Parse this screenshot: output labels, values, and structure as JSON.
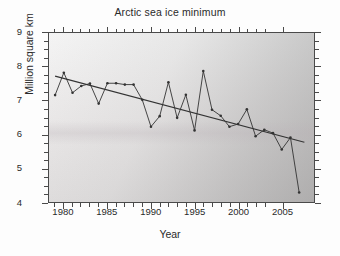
{
  "chart_data": {
    "type": "line",
    "title": "Arctic sea ice minimum",
    "xlabel": "Year",
    "ylabel": "Million square km",
    "xlim": [
      1978.3,
      2008.7
    ],
    "ylim": [
      4,
      9
    ],
    "xticks": [
      1980,
      1985,
      1990,
      1995,
      2000,
      2005
    ],
    "xtick_labels": [
      "1980",
      "1985",
      "1990",
      "1995",
      "2000",
      "2005"
    ],
    "yticks": [
      4,
      5,
      6,
      7,
      8,
      9
    ],
    "ytick_labels": [
      "4",
      "5",
      "6",
      "7",
      "8",
      "9"
    ],
    "minor_tick_interval_x": 1,
    "minor_tick_interval_y": 0.25,
    "grid": false,
    "legend": "none",
    "x": [
      1979,
      1980,
      1981,
      1982,
      1983,
      1984,
      1985,
      1986,
      1987,
      1988,
      1989,
      1990,
      1991,
      1992,
      1993,
      1994,
      1995,
      1996,
      1997,
      1998,
      1999,
      2000,
      2001,
      2002,
      2003,
      2004,
      2005,
      2006,
      2007
    ],
    "series": [
      {
        "name": "Arctic sea ice minimum extent",
        "marker": "dot",
        "color": "#333333",
        "values": [
          7.17,
          7.83,
          7.24,
          7.44,
          7.51,
          6.92,
          7.52,
          7.52,
          7.48,
          7.48,
          7.03,
          6.24,
          6.55,
          7.55,
          6.5,
          7.18,
          6.13,
          7.88,
          6.74,
          6.56,
          6.24,
          6.32,
          6.75,
          5.96,
          6.15,
          6.05,
          5.57,
          5.92,
          4.3
        ]
      }
    ],
    "trend_line": {
      "name": "Linear trend",
      "color": "#333333",
      "x": [
        1979,
        2007.6
      ],
      "y": [
        7.73,
        5.78
      ]
    }
  }
}
